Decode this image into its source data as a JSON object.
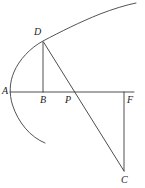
{
  "figure": {
    "kind": "geometry-diagram",
    "background_color": "#ffffff",
    "stroke_color": "#3a3a3a",
    "curve_color": "#4a4a4a",
    "label_color": "#242424",
    "canvas": {
      "width": 145,
      "height": 188
    },
    "points": [
      {
        "id": "A",
        "label": "A",
        "x": 12,
        "y": 92,
        "label_x": 2,
        "label_y": 86
      },
      {
        "id": "D",
        "label": "D",
        "x": 43,
        "y": 41,
        "label_x": 34,
        "label_y": 27
      },
      {
        "id": "B",
        "label": "B",
        "x": 43,
        "y": 92,
        "label_x": 40,
        "label_y": 95
      },
      {
        "id": "P",
        "label": "P",
        "x": 75,
        "y": 92,
        "label_x": 65,
        "label_y": 95
      },
      {
        "id": "F",
        "label": "F",
        "x": 124,
        "y": 92,
        "label_x": 127,
        "label_y": 95
      },
      {
        "id": "C",
        "label": "C",
        "x": 124,
        "y": 172,
        "label_x": 121,
        "label_y": 175
      }
    ],
    "segments": [
      {
        "id": "axis-AF",
        "from": "A",
        "to": "F",
        "description": "horizontal axis from A through B and P to F"
      },
      {
        "id": "segment-DB",
        "from": "D",
        "to": "B",
        "description": "vertical segment from D down to B on the axis"
      },
      {
        "id": "segment-DC",
        "from": "D",
        "to": "C",
        "description": "diagonal chord from D through P down to C"
      },
      {
        "id": "segment-FC",
        "from": "F",
        "to": "C",
        "description": "vertical segment from F down to C"
      }
    ],
    "curve": {
      "id": "parabola-arc",
      "description": "parabolic arc opening to the right, passing through the axis near A, up through D and off to the upper right, and down to the lower left below the axis",
      "vertex": {
        "x": 3,
        "y": 100
      },
      "upper_end": {
        "x": 136,
        "y": 3
      },
      "lower_end": {
        "x": 45,
        "y": 143
      }
    }
  }
}
